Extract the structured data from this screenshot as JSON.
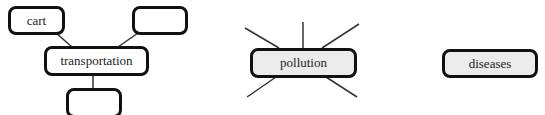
{
  "diagrams": {
    "transportation_map": {
      "center": "transportation",
      "branches": [
        "cart",
        "",
        ""
      ]
    },
    "pollution_map": {
      "center": "pollution",
      "spokes": 5
    },
    "diseases_node": {
      "label": "diseases"
    }
  },
  "colors": {
    "border": "#111111",
    "filled_node": "#ebebeb",
    "line": "#333333"
  }
}
